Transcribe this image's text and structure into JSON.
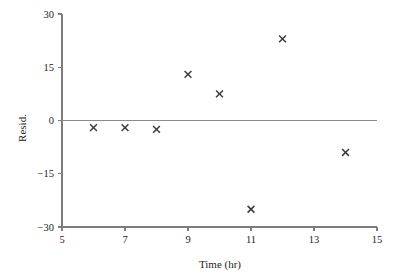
{
  "chart_data": {
    "type": "scatter",
    "title": "",
    "xlabel": "Time (hr)",
    "ylabel": "Resid.",
    "xlim": [
      5,
      15
    ],
    "ylim": [
      -30,
      30
    ],
    "xticks": [
      5,
      7,
      9,
      11,
      13,
      15
    ],
    "yticks": [
      30,
      15,
      0,
      -15,
      -30
    ],
    "xtick_labels": [
      "5",
      "7",
      "9",
      "11",
      "13",
      "15"
    ],
    "ytick_labels": [
      "30",
      "15",
      "0",
      "−15",
      "−30"
    ],
    "grid": false,
    "legend": false,
    "marker": "x",
    "reference_line": {
      "y": 0,
      "label": "zero-residual-line"
    },
    "x": [
      6,
      7,
      8,
      9,
      10,
      11,
      12,
      14
    ],
    "values": [
      -2,
      -2,
      -2.5,
      13,
      7.5,
      -25,
      23,
      -9
    ],
    "points": [
      {
        "x": 6,
        "y": -2
      },
      {
        "x": 7,
        "y": -2
      },
      {
        "x": 8,
        "y": -2.5
      },
      {
        "x": 9,
        "y": 13
      },
      {
        "x": 10,
        "y": 7.5
      },
      {
        "x": 11,
        "y": -25
      },
      {
        "x": 12,
        "y": 23
      },
      {
        "x": 14,
        "y": -9
      }
    ],
    "colors": {
      "marker": "#3a3a3a",
      "axis": "#7d7d7d",
      "zero_line": "#8a8a8a",
      "text": "#1c1c1c",
      "background": "#ffffff"
    }
  }
}
